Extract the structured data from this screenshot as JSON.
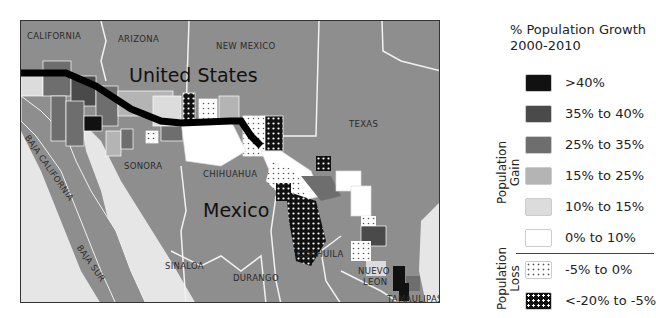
{
  "map": {
    "labels": {
      "california": "CALIFORNIA",
      "arizona": "ARIZONA",
      "new_mexico": "NEW MEXICO",
      "texas": "TEXAS",
      "united_states": "United States",
      "mexico": "Mexico",
      "baja_california": "BAJA CALIFORNIA",
      "baja_sur": "BAJA SUR",
      "sonora": "SONORA",
      "chihuahua": "CHIHUAHUA",
      "sinaloa": "SINALOA",
      "durango": "DURANGO",
      "coahuila": "COAHUILA",
      "nuevo_leon_1": "NUEVO",
      "nuevo_leon_2": "LEON",
      "tamaulipas": "TAMAULIPAS"
    },
    "colors": {
      "land": "#8e8e8e",
      "water": "#e6e6e6",
      "border": "#f2f2f2",
      "boundary_line": "#000000"
    }
  },
  "legend": {
    "title_line1": "% Population Growth",
    "title_line2": "2000-2010",
    "gain_group_line1": "Population",
    "gain_group_line2": "Gain",
    "loss_group_line1": "Population",
    "loss_group_line2": "Loss",
    "items": [
      {
        "label": ">40%",
        "color": "#111111",
        "pattern": "solid"
      },
      {
        "label": "35% to 40%",
        "color": "#4a4a4a",
        "pattern": "solid"
      },
      {
        "label": "25% to 35%",
        "color": "#6e6e6e",
        "pattern": "solid"
      },
      {
        "label": "15% to 25%",
        "color": "#b4b4b4",
        "pattern": "solid"
      },
      {
        "label": "10% to 15%",
        "color": "#dcdcdc",
        "pattern": "solid"
      },
      {
        "label": "0% to 10%",
        "color": "#ffffff",
        "pattern": "solid"
      },
      {
        "label": "-5% to 0%",
        "color": "#ffffff",
        "pattern": "dots"
      },
      {
        "label": "<-20% to -5%",
        "color": "#111111",
        "pattern": "white-dots"
      }
    ]
  }
}
